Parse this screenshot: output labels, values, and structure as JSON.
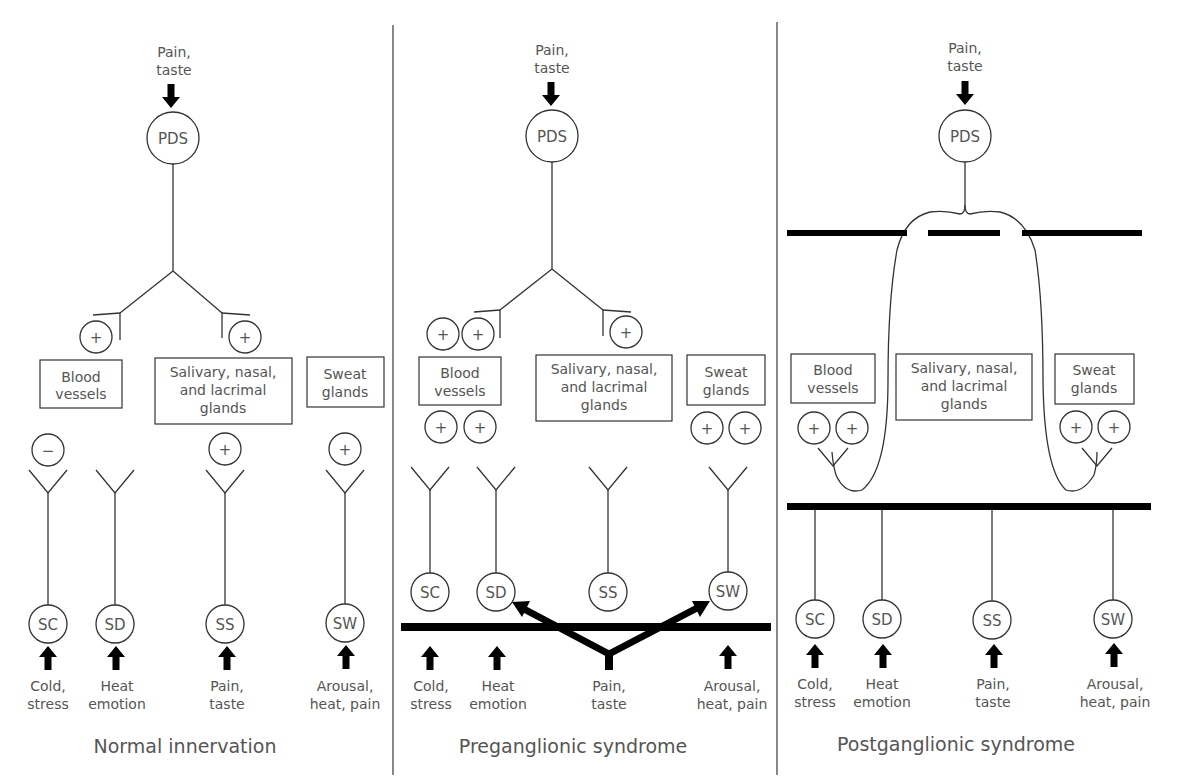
{
  "panels": [
    {
      "title": "Normal innervation",
      "top_stimulus": [
        "Pain,",
        "taste"
      ],
      "top_node": "PDS",
      "organs": [
        {
          "lines": [
            "Blood",
            "vessels"
          ]
        },
        {
          "lines": [
            "Salivary, nasal,",
            "and lacrimal",
            "glands"
          ]
        },
        {
          "lines": [
            "Sweat",
            "glands"
          ]
        }
      ],
      "parasympathetic_effects": [
        "+",
        "+"
      ],
      "sympathetic_effects": [
        "−",
        "",
        "+",
        "+"
      ],
      "ganglia": [
        "SC",
        "SD",
        "SS",
        "SW"
      ],
      "stimuli": [
        [
          "Cold,",
          "stress"
        ],
        [
          "Heat",
          "emotion"
        ],
        [
          "Pain,",
          "taste"
        ],
        [
          "Arousal,",
          "heat, pain"
        ]
      ]
    },
    {
      "title": "Preganglionic syndrome",
      "top_stimulus": [
        "Pain,",
        "taste"
      ],
      "top_node": "PDS",
      "organs": [
        {
          "lines": [
            "Blood",
            "vessels"
          ]
        },
        {
          "lines": [
            "Salivary, nasal,",
            "and lacrimal",
            "glands"
          ]
        },
        {
          "lines": [
            "Sweat",
            "glands"
          ]
        }
      ],
      "effects_above_blood": [
        "+",
        "+"
      ],
      "effect_above_salivary": "+",
      "effects_below_blood": [
        "+",
        "+"
      ],
      "effects_below_sweat": [
        "+",
        "+"
      ],
      "ganglia": [
        "SC",
        "SD",
        "SS",
        "SW"
      ],
      "stimuli": [
        [
          "Cold,",
          "stress"
        ],
        [
          "Heat",
          "emotion"
        ],
        [
          "Pain,",
          "taste"
        ],
        [
          "Arousal,",
          "heat, pain"
        ]
      ]
    },
    {
      "title": "Postganglionic syndrome",
      "top_stimulus": [
        "Pain,",
        "taste"
      ],
      "top_node": "PDS",
      "organs": [
        {
          "lines": [
            "Blood",
            "vessels"
          ]
        },
        {
          "lines": [
            "Salivary, nasal,",
            "and lacrimal",
            "glands"
          ]
        },
        {
          "lines": [
            "Sweat",
            "glands"
          ]
        }
      ],
      "effects_blood": [
        "+",
        "+"
      ],
      "effects_sweat": [
        "+",
        "+"
      ],
      "ganglia": [
        "SC",
        "SD",
        "SS",
        "SW"
      ],
      "stimuli": [
        [
          "Cold,",
          "stress"
        ],
        [
          "Heat",
          "emotion"
        ],
        [
          "Pain,",
          "taste"
        ],
        [
          "Arousal,",
          "heat, pain"
        ]
      ]
    }
  ]
}
